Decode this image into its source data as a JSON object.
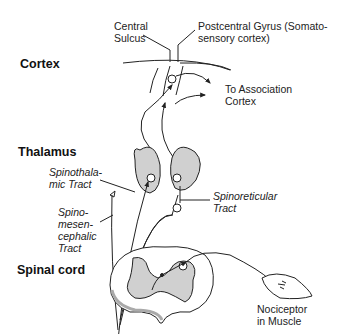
{
  "diagram": {
    "colors": {
      "stroke": "#222222",
      "gray_matter": "#d0d0d0",
      "background": "#ffffff"
    },
    "levels": [
      {
        "id": "cortex",
        "label": "Cortex"
      },
      {
        "id": "thalamus",
        "label": "Thalamus"
      },
      {
        "id": "spinal_cord",
        "label": "Spinal cord"
      }
    ],
    "labels": {
      "central_sulcus": "Central\nSulcus",
      "postcentral_gyrus": "Postcentral Gyrus (Somato-\nsensory cortex)",
      "association_cortex": "To Association\nCortex",
      "spinothalamic": "Spinothala-\nmic Tract",
      "spinoreticular": "Spinoreticular\nTract",
      "spinomesencephalic": "Spino-\nmesen-\ncephalic\nTract",
      "nociceptor": "Nociceptor\nin Muscle"
    },
    "edges": [
      {
        "from": "Nociceptor in Muscle",
        "to": "Spinal cord dorsal horn"
      },
      {
        "from": "Spinal cord",
        "to": "Thalamus",
        "via": "Spinothalamic Tract"
      },
      {
        "from": "Spinal cord",
        "to": "Reticular formation",
        "via": "Spinoreticular Tract"
      },
      {
        "from": "Spinal cord",
        "to": "Mesencephalon",
        "via": "Spinomesencephalic Tract"
      },
      {
        "from": "Thalamus",
        "to": "Postcentral Gyrus (Somatosensory cortex)"
      },
      {
        "from": "Thalamus",
        "to": "Association Cortex"
      }
    ]
  }
}
